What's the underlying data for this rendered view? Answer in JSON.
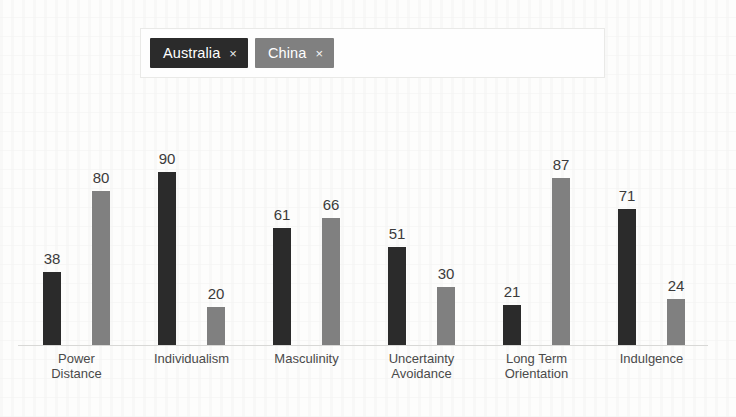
{
  "legend": {
    "items": [
      {
        "label": "Australia",
        "color": "#2b2b2b",
        "remove_icon": "×"
      },
      {
        "label": "China",
        "color": "#808080",
        "remove_icon": "×"
      }
    ]
  },
  "chart_data": {
    "type": "bar",
    "title": "",
    "subtitle": "",
    "xlabel": "",
    "ylabel": "",
    "ylim": [
      0,
      100
    ],
    "grid": false,
    "legend_position": "top",
    "categories": [
      "Power\nDistance",
      "Individualism",
      "Masculinity",
      "Uncertainty\nAvoidance",
      "Long Term\nOrientation",
      "Indulgence"
    ],
    "series": [
      {
        "name": "Australia",
        "color": "#2b2b2b",
        "values": [
          38,
          90,
          61,
          51,
          21,
          71
        ]
      },
      {
        "name": "China",
        "color": "#808080",
        "values": [
          80,
          20,
          66,
          30,
          87,
          24
        ]
      }
    ],
    "data_labels": [
      [
        "38",
        "80"
      ],
      [
        "90",
        "20"
      ],
      [
        "61",
        "66"
      ],
      [
        "51",
        "30"
      ],
      [
        "21",
        "87"
      ],
      [
        "71",
        "24"
      ]
    ]
  }
}
